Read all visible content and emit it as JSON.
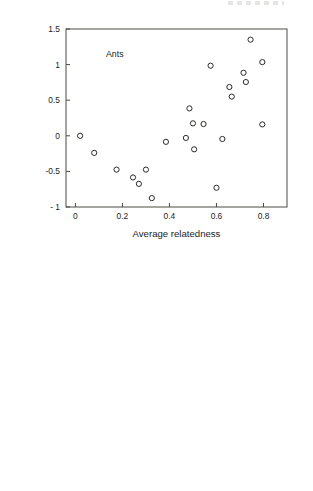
{
  "figure": {
    "name": "two-panel-scatter-figure",
    "background": "#ffffff",
    "marker_color": "#2b2b28",
    "axis_color": "#4a4a42"
  },
  "chart_data": [
    {
      "id": "top",
      "type": "scatter",
      "title": "",
      "xlabel": "Average relatedness",
      "ylabel": "Standardized parasite richness",
      "xlim": [
        -0.04,
        0.9
      ],
      "ylim": [
        -1.0,
        1.5
      ],
      "xticks": [
        0,
        0.2,
        0.4,
        0.6,
        0.8
      ],
      "xticklabels": [
        "0",
        "0.2",
        "0.4",
        "0.6",
        "0.8"
      ],
      "yticks": [
        -1,
        -0.5,
        0,
        0.5,
        1,
        1.5
      ],
      "yticklabels": [
        "- 1",
        "-0.5",
        "0",
        "0.5",
        "1",
        "1.5"
      ],
      "grid": false,
      "legend": "none",
      "annotations": [
        {
          "text": "Ants",
          "x": 0.13,
          "y": 1.11
        }
      ],
      "marker": "open-circle",
      "points": [
        {
          "x": 0.02,
          "y": 0.0
        },
        {
          "x": 0.08,
          "y": -0.24
        },
        {
          "x": 0.175,
          "y": -0.475
        },
        {
          "x": 0.245,
          "y": -0.585
        },
        {
          "x": 0.27,
          "y": -0.675
        },
        {
          "x": 0.3,
          "y": -0.475
        },
        {
          "x": 0.325,
          "y": -0.875
        },
        {
          "x": 0.385,
          "y": -0.085
        },
        {
          "x": 0.47,
          "y": -0.03
        },
        {
          "x": 0.485,
          "y": 0.385
        },
        {
          "x": 0.5,
          "y": 0.175
        },
        {
          "x": 0.505,
          "y": -0.19
        },
        {
          "x": 0.545,
          "y": 0.165
        },
        {
          "x": 0.575,
          "y": 0.985
        },
        {
          "x": 0.6,
          "y": -0.73
        },
        {
          "x": 0.625,
          "y": -0.045
        },
        {
          "x": 0.655,
          "y": 0.685
        },
        {
          "x": 0.665,
          "y": 0.55
        },
        {
          "x": 0.715,
          "y": 0.885
        },
        {
          "x": 0.725,
          "y": 0.755
        },
        {
          "x": 0.745,
          "y": 1.35
        },
        {
          "x": 0.795,
          "y": 1.035
        },
        {
          "x": 0.795,
          "y": 0.16
        }
      ]
    },
    {
      "id": "bottom",
      "type": "scatter",
      "title": "",
      "xlabel": "Contrast in Relatedness",
      "ylabel": "Contrast in standardized parasite richness",
      "xlim": [
        -0.022,
        0.4
      ],
      "ylim": [
        -0.05,
        0.3
      ],
      "xticks": [
        0,
        0.1,
        0.2,
        0.3,
        0.4
      ],
      "xticklabels": [
        "0",
        "0.1",
        "0.2",
        "0.3",
        "0.4"
      ],
      "yticks": [
        -0.05,
        0,
        0.05,
        0.1,
        0.15,
        0.2,
        0.25,
        0.3
      ],
      "yticklabels": [
        "-0.05",
        "0",
        "0.05",
        "0.1",
        "0.15",
        "0.2",
        "0.25",
        "0.3"
      ],
      "grid": false,
      "legend": "none",
      "reference_lines": [
        {
          "axis": "x",
          "value": 0,
          "style": "dashed"
        },
        {
          "axis": "y",
          "value": 0,
          "style": "dashed"
        }
      ],
      "annotations": [
        {
          "text": "Ants",
          "x": 0.263,
          "y": 0.252
        }
      ],
      "marker": "open-circle",
      "points": [
        {
          "x": 0.0005,
          "y": 0.004
        },
        {
          "x": 0.0015,
          "y": 0.0
        },
        {
          "x": 0.002,
          "y": -0.021
        },
        {
          "x": 0.003,
          "y": -0.001
        },
        {
          "x": 0.0055,
          "y": 0.003
        },
        {
          "x": 0.006,
          "y": -0.022
        },
        {
          "x": 0.01,
          "y": 0.009
        },
        {
          "x": 0.014,
          "y": -0.02
        },
        {
          "x": 0.0175,
          "y": 0.014
        },
        {
          "x": 0.0245,
          "y": 0.051
        },
        {
          "x": 0.0265,
          "y": 0.096
        },
        {
          "x": 0.0305,
          "y": 0.109
        },
        {
          "x": 0.04,
          "y": 0.037
        },
        {
          "x": 0.08,
          "y": 0.252
        },
        {
          "x": 0.0845,
          "y": 0.094
        },
        {
          "x": 0.343,
          "y": 0.059
        }
      ]
    }
  ]
}
